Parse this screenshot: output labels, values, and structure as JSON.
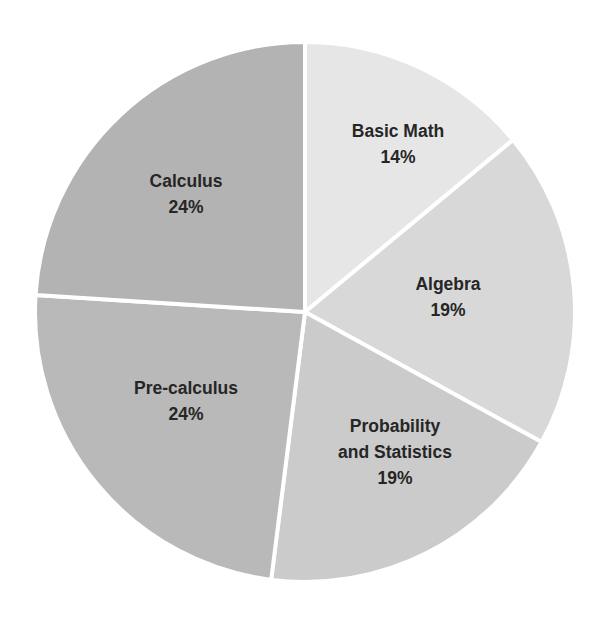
{
  "chart_data": {
    "type": "pie",
    "title": "",
    "start_angle_deg": 0,
    "direction": "clockwise",
    "separator_color": "#ffffff",
    "text_color": "#262626",
    "slices": [
      {
        "label": "Basic Math",
        "label_lines": [
          "Basic Math",
          "14%"
        ],
        "value": 14,
        "display": "14%",
        "color": "#e6e6e6",
        "label_pos": [
          398,
          137
        ]
      },
      {
        "label": "Algebra",
        "label_lines": [
          "Algebra",
          "19%"
        ],
        "value": 19,
        "display": "19%",
        "color": "#d8d8d8",
        "label_pos": [
          448,
          290
        ]
      },
      {
        "label": "Probability and Statistics",
        "label_lines": [
          "Probability",
          "and Statistics",
          "19%"
        ],
        "value": 19,
        "display": "19%",
        "color": "#cbcbcb",
        "label_pos": [
          395,
          432
        ]
      },
      {
        "label": "Pre-calculus",
        "label_lines": [
          "Pre-calculus",
          "24%"
        ],
        "value": 24,
        "display": "24%",
        "color": "#b9b9b9",
        "label_pos": [
          186,
          394
        ]
      },
      {
        "label": "Calculus",
        "label_lines": [
          "Calculus",
          "24%"
        ],
        "value": 24,
        "display": "24%",
        "color": "#b3b3b3",
        "label_pos": [
          186,
          187
        ]
      }
    ],
    "categories": [
      "Basic Math",
      "Algebra",
      "Probability and Statistics",
      "Pre-calculus",
      "Calculus"
    ],
    "values": [
      14,
      19,
      19,
      24,
      24
    ]
  }
}
